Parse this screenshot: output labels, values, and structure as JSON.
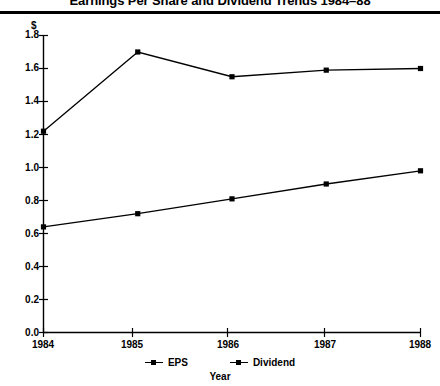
{
  "chart_data": {
    "type": "line",
    "title": "Earnings Per Share and Dividend Trends 1984–88",
    "subtitle": "",
    "xlabel": "Year",
    "ylabel": "$",
    "categories": [
      "1984",
      "1985",
      "1986",
      "1987",
      "1988"
    ],
    "x": [
      1984,
      1985,
      1986,
      1987,
      1988
    ],
    "series": [
      {
        "name": "EPS",
        "values": [
          1.22,
          1.7,
          1.55,
          1.59,
          1.6
        ],
        "color": "#000000",
        "marker": "square"
      },
      {
        "name": "Dividend",
        "values": [
          0.64,
          0.72,
          0.81,
          0.9,
          0.98
        ],
        "color": "#000000",
        "marker": "square"
      }
    ],
    "ylim": [
      0.0,
      1.8
    ],
    "ytick_values": [
      0.0,
      0.2,
      0.4,
      0.6,
      0.8,
      1.0,
      1.2,
      1.4,
      1.6,
      1.8
    ],
    "ytick_labels": [
      "0.0",
      "0.2",
      "0.4",
      "0.6",
      "0.8",
      "1.0",
      "1.2",
      "1.4",
      "1.6",
      "1.8"
    ],
    "xtick_labels": [
      "1984",
      "1985",
      "1986",
      "1987",
      "1988"
    ],
    "grid": false,
    "legend_position": "bottom",
    "legend_entries": [
      "EPS",
      "Dividend"
    ]
  },
  "header": {
    "title": "Earnings Per Share and Dividend Trends 1984–88"
  },
  "axes": {
    "y_unit": "$",
    "x_title": "Year"
  },
  "legend": {
    "items": [
      {
        "label": "EPS"
      },
      {
        "label": "Dividend"
      }
    ]
  }
}
